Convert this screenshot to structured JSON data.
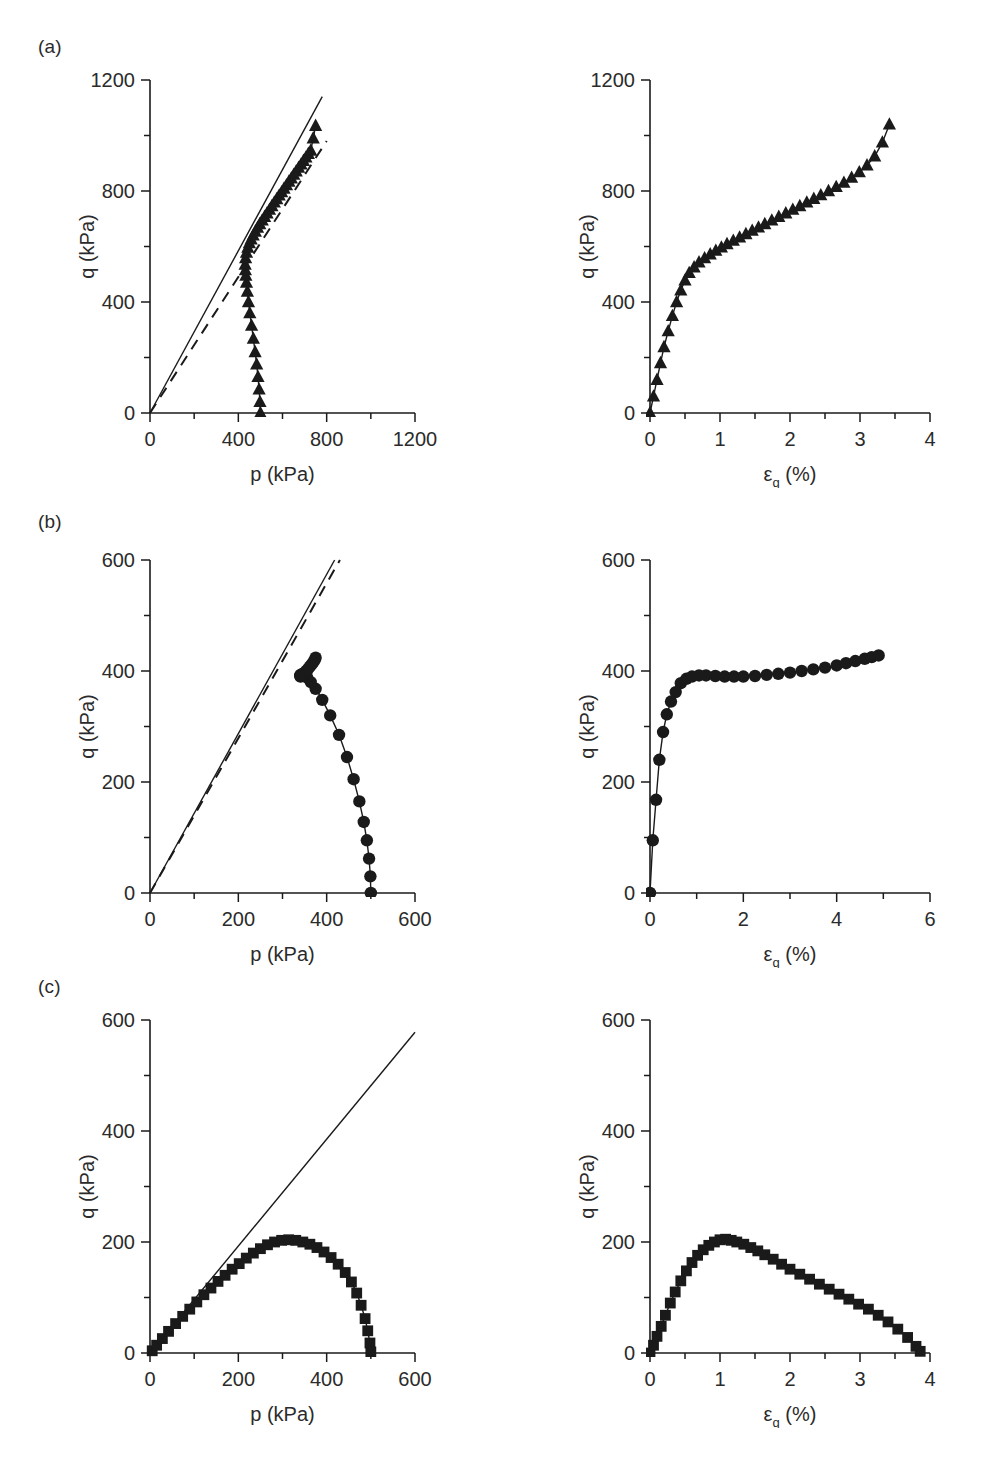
{
  "figure": {
    "background": "#ffffff",
    "ink": "#1a1a1a",
    "panel_labels": [
      "(a)",
      "(b)",
      "(c)"
    ]
  },
  "chart_data": [
    {
      "id": "a-left",
      "type": "line",
      "title": "",
      "xlabel": "p (kPa)",
      "ylabel": "q (kPa)",
      "xlim": [
        0,
        1200
      ],
      "ylim": [
        0,
        1200
      ],
      "xticks": [
        0,
        400,
        800,
        1200
      ],
      "yticks": [
        0,
        400,
        800,
        1200
      ],
      "xminor_step": 200,
      "yminor_step": 200,
      "xticklabels": [
        "0",
        "400",
        "800",
        "1200"
      ],
      "yticklabels": [
        "0",
        "400",
        "800",
        "1200"
      ],
      "grid": false,
      "legend": "none",
      "marker": "triangle-up",
      "series": [
        {
          "name": "CSL (solid reference line)",
          "style": "solid-line",
          "marker": "none",
          "x": [
            0,
            780
          ],
          "y": [
            0,
            1140
          ]
        },
        {
          "name": "Reference line (dashed)",
          "style": "dashed-line",
          "marker": "none",
          "x": [
            0,
            800
          ],
          "y": [
            0,
            980
          ]
        },
        {
          "name": "Stress path (p, q) - dense triangles",
          "style": "solid-line-with-markers",
          "marker": "triangle-up",
          "x": [
            500,
            498,
            494,
            489,
            483,
            476,
            468,
            460,
            452,
            446,
            441,
            437,
            434,
            432,
            431,
            433,
            437,
            443,
            450,
            458,
            467,
            477,
            487,
            497,
            508,
            519,
            530,
            541,
            552,
            563,
            574,
            585,
            596,
            607,
            618,
            629,
            640,
            651,
            662,
            673,
            684,
            695,
            706,
            717,
            728,
            739,
            750
          ],
          "y": [
            0,
            40,
            85,
            130,
            175,
            220,
            268,
            315,
            360,
            400,
            438,
            470,
            495,
            515,
            535,
            558,
            578,
            596,
            612,
            626,
            640,
            654,
            668,
            681,
            694,
            707,
            720,
            733,
            746,
            759,
            771,
            784,
            796,
            809,
            821,
            834,
            846,
            859,
            871,
            884,
            896,
            909,
            921,
            934,
            946,
            990,
            1035
          ]
        }
      ]
    },
    {
      "id": "a-right",
      "type": "line",
      "title": "",
      "xlabel": "εq (%)",
      "xlabel_base": "ε",
      "xlabel_sub": "q",
      "xlabel_tail": " (%)",
      "ylabel": "q (kPa)",
      "xlim": [
        0,
        4
      ],
      "ylim": [
        0,
        1200
      ],
      "xticks": [
        0,
        1,
        2,
        3,
        4
      ],
      "yticks": [
        0,
        400,
        800,
        1200
      ],
      "xminor_step": 0.5,
      "yminor_step": 200,
      "xticklabels": [
        "0",
        "1",
        "2",
        "3",
        "4"
      ],
      "yticklabels": [
        "0",
        "400",
        "800",
        "1200"
      ],
      "grid": false,
      "legend": "none",
      "marker": "triangle-up",
      "series": [
        {
          "name": "q vs axial strain",
          "style": "solid-line-with-markers",
          "marker": "triangle-up",
          "x": [
            0.0,
            0.05,
            0.1,
            0.15,
            0.2,
            0.26,
            0.32,
            0.38,
            0.44,
            0.5,
            0.56,
            0.63,
            0.7,
            0.78,
            0.86,
            0.94,
            1.02,
            1.1,
            1.19,
            1.28,
            1.37,
            1.46,
            1.55,
            1.64,
            1.74,
            1.84,
            1.94,
            2.04,
            2.14,
            2.24,
            2.34,
            2.44,
            2.55,
            2.66,
            2.77,
            2.88,
            2.99,
            3.1,
            3.21,
            3.32,
            3.42
          ],
          "y": [
            0,
            60,
            120,
            180,
            238,
            295,
            350,
            400,
            442,
            478,
            505,
            525,
            543,
            558,
            572,
            585,
            597,
            609,
            621,
            633,
            645,
            657,
            669,
            681,
            694,
            707,
            720,
            733,
            746,
            759,
            772,
            785,
            800,
            815,
            830,
            848,
            868,
            893,
            925,
            975,
            1040
          ]
        }
      ]
    },
    {
      "id": "b-left",
      "type": "line",
      "title": "",
      "xlabel": "p (kPa)",
      "ylabel": "q (kPa)",
      "xlim": [
        0,
        600
      ],
      "ylim": [
        0,
        600
      ],
      "xticks": [
        0,
        200,
        400,
        600
      ],
      "yticks": [
        0,
        200,
        400,
        600
      ],
      "xminor_step": 100,
      "yminor_step": 100,
      "xticklabels": [
        "0",
        "200",
        "400",
        "600"
      ],
      "yticklabels": [
        "0",
        "200",
        "400",
        "600"
      ],
      "grid": false,
      "legend": "none",
      "marker": "circle",
      "series": [
        {
          "name": "CSL (solid reference line)",
          "style": "solid-line",
          "marker": "none",
          "x": [
            0,
            418
          ],
          "y": [
            0,
            600
          ]
        },
        {
          "name": "Reference line (dashed)",
          "style": "dashed-line",
          "marker": "none",
          "x": [
            0,
            430
          ],
          "y": [
            0,
            600
          ]
        },
        {
          "name": "Effective stress path - circles",
          "style": "solid-line-with-markers",
          "marker": "circle",
          "x": [
            500,
            499,
            496,
            491,
            484,
            474,
            461,
            446,
            428,
            408,
            390,
            375,
            364,
            356,
            350,
            346,
            343,
            341,
            340,
            341,
            343,
            346,
            350,
            354,
            358,
            362,
            366,
            370,
            373,
            375
          ],
          "y": [
            0,
            30,
            62,
            95,
            128,
            165,
            205,
            245,
            285,
            320,
            348,
            368,
            380,
            388,
            392,
            394,
            394,
            393,
            391,
            390,
            392,
            394,
            397,
            400,
            404,
            408,
            412,
            416,
            420,
            424
          ]
        }
      ]
    },
    {
      "id": "b-right",
      "type": "line",
      "title": "",
      "xlabel": "εq (%)",
      "xlabel_base": "ε",
      "xlabel_sub": "q",
      "xlabel_tail": " (%)",
      "ylabel": "q (kPa)",
      "xlim": [
        0,
        6
      ],
      "ylim": [
        0,
        600
      ],
      "xticks": [
        0,
        2,
        4,
        6
      ],
      "yticks": [
        0,
        200,
        400,
        600
      ],
      "xminor_step": 1,
      "yminor_step": 100,
      "xticklabels": [
        "0",
        "2",
        "4",
        "6"
      ],
      "yticklabels": [
        "0",
        "200",
        "400",
        "600"
      ],
      "grid": false,
      "legend": "none",
      "marker": "circle",
      "series": [
        {
          "name": "q vs axial strain",
          "style": "solid-line-with-markers",
          "marker": "circle",
          "x": [
            0.0,
            0.06,
            0.13,
            0.2,
            0.28,
            0.36,
            0.45,
            0.55,
            0.66,
            0.78,
            0.9,
            1.05,
            1.2,
            1.4,
            1.6,
            1.8,
            2.0,
            2.25,
            2.5,
            2.75,
            3.0,
            3.25,
            3.5,
            3.75,
            4.0,
            4.2,
            4.4,
            4.6,
            4.75,
            4.9
          ],
          "y": [
            0,
            95,
            168,
            240,
            290,
            322,
            345,
            362,
            378,
            386,
            390,
            392,
            392,
            391,
            390,
            390,
            390,
            391,
            393,
            395,
            397,
            400,
            403,
            406,
            410,
            414,
            418,
            422,
            425,
            428
          ]
        }
      ]
    },
    {
      "id": "c-left",
      "type": "line",
      "title": "",
      "xlabel": "p (kPa)",
      "ylabel": "q (kPa)",
      "xlim": [
        0,
        600
      ],
      "ylim": [
        0,
        600
      ],
      "xticks": [
        0,
        200,
        400,
        600
      ],
      "yticks": [
        0,
        200,
        400,
        600
      ],
      "xminor_step": 100,
      "yminor_step": 100,
      "xticklabels": [
        "0",
        "200",
        "400",
        "600"
      ],
      "yticklabels": [
        "0",
        "200",
        "400",
        "600"
      ],
      "grid": false,
      "legend": "none",
      "marker": "square",
      "series": [
        {
          "name": "CSL (solid reference line)",
          "style": "solid-line",
          "marker": "none",
          "x": [
            0,
            600
          ],
          "y": [
            0,
            578
          ]
        },
        {
          "name": "Effective stress path - squares",
          "style": "solid-line-with-markers",
          "marker": "square",
          "x": [
            5,
            15,
            28,
            42,
            58,
            74,
            90,
            106,
            122,
            138,
            154,
            170,
            186,
            202,
            218,
            234,
            250,
            266,
            282,
            298,
            314,
            330,
            346,
            362,
            378,
            394,
            410,
            426,
            442,
            456,
            468,
            478,
            487,
            493,
            498,
            500
          ],
          "y": [
            4,
            14,
            26,
            39,
            53,
            66,
            79,
            92,
            105,
            117,
            129,
            140,
            151,
            161,
            171,
            180,
            188,
            195,
            200,
            203,
            204,
            203,
            200,
            196,
            190,
            182,
            172,
            160,
            145,
            128,
            108,
            86,
            62,
            40,
            18,
            2
          ]
        }
      ]
    },
    {
      "id": "c-right",
      "type": "line",
      "title": "",
      "xlabel": "εq (%)",
      "xlabel_base": "ε",
      "xlabel_sub": "q",
      "xlabel_tail": " (%)",
      "ylabel": "q (kPa)",
      "xlim": [
        0,
        4
      ],
      "ylim": [
        0,
        600
      ],
      "xticks": [
        0,
        1,
        2,
        3,
        4
      ],
      "yticks": [
        0,
        200,
        400,
        600
      ],
      "xminor_step": 0.5,
      "yminor_step": 100,
      "xticklabels": [
        "0",
        "1",
        "2",
        "3",
        "4"
      ],
      "yticklabels": [
        "0",
        "200",
        "400",
        "600"
      ],
      "grid": false,
      "legend": "none",
      "marker": "square",
      "series": [
        {
          "name": "q vs axial strain",
          "style": "solid-line-with-markers",
          "marker": "square",
          "x": [
            0.0,
            0.05,
            0.1,
            0.16,
            0.22,
            0.29,
            0.36,
            0.44,
            0.52,
            0.6,
            0.68,
            0.76,
            0.84,
            0.92,
            1.0,
            1.08,
            1.16,
            1.24,
            1.34,
            1.44,
            1.54,
            1.64,
            1.76,
            1.88,
            2.0,
            2.14,
            2.28,
            2.42,
            2.56,
            2.7,
            2.84,
            2.98,
            3.12,
            3.26,
            3.4,
            3.54,
            3.68,
            3.8,
            3.86
          ],
          "y": [
            0,
            14,
            30,
            48,
            68,
            90,
            110,
            130,
            148,
            163,
            176,
            186,
            194,
            200,
            204,
            205,
            203,
            200,
            196,
            190,
            184,
            177,
            169,
            160,
            151,
            142,
            133,
            124,
            115,
            106,
            97,
            88,
            79,
            68,
            56,
            43,
            28,
            12,
            3
          ]
        }
      ]
    }
  ]
}
